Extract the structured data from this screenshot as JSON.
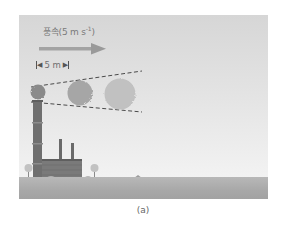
{
  "figure": {
    "caption": "(a)",
    "wind": {
      "label_text": "풍속(5 m s",
      "label_exponent": "-1",
      "label_close": ")",
      "direction": "right",
      "arrow_color": "#9a9a9a"
    },
    "distance_marker": {
      "label": "5 m"
    },
    "puffs": [
      {
        "name": "puff-1",
        "color": "#8c8c8c",
        "size": "small"
      },
      {
        "name": "puff-2",
        "color": "#a9a9a9",
        "size": "medium"
      },
      {
        "name": "puff-3",
        "color": "#c0c0c0",
        "size": "large"
      }
    ],
    "plume_boundary": "dashed",
    "colors": {
      "sky_top": "#d6d6d6",
      "sky_bottom": "#f3f3f3",
      "ground": "#a8a8a8",
      "stack": "#6f6f6f",
      "factory": "#7a7a7a",
      "tree": "#bdbdbd"
    }
  }
}
